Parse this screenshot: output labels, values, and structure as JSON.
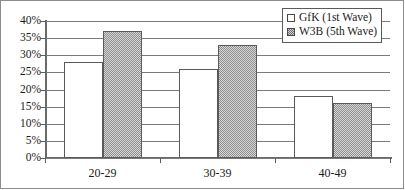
{
  "chart_data": {
    "type": "bar",
    "title": "",
    "subtitle": "",
    "xlabel": "",
    "ylabel": "",
    "categories": [
      "20-29",
      "30-39",
      "40-49"
    ],
    "series": [
      {
        "name": "GfK (1st Wave)",
        "values": [
          28,
          26,
          18
        ],
        "swatch": "white"
      },
      {
        "name": "W3B (5th Wave)",
        "values": [
          37,
          33,
          16
        ],
        "swatch": "hatched-gray"
      }
    ],
    "ylim": [
      0,
      40
    ],
    "ytick_step": 5,
    "ytick_labels": [
      "40%",
      "35%",
      "30%",
      "25%",
      "20%",
      "15%",
      "10%",
      "5%",
      "0%"
    ],
    "ytick_values": [
      40,
      35,
      30,
      25,
      20,
      15,
      10,
      5,
      0
    ],
    "grid": true,
    "legend_position": "top-right",
    "value_format": "percent"
  },
  "legend": {
    "entries": [
      {
        "label": "GfK (1st Wave)"
      },
      {
        "label": "W3B (5th Wave)"
      }
    ]
  },
  "colors": {
    "series_0_fill": "#ffffff",
    "series_1_fill": "#d8d8d8",
    "series_1_pattern": "#8e8e8e",
    "bar_stroke": "#5a5a5a",
    "gridline": "#7a7a7a",
    "axis": "#6a6a6a",
    "text": "#1a1a1a",
    "frame": "#8d8d8d",
    "background": "#ffffff"
  }
}
